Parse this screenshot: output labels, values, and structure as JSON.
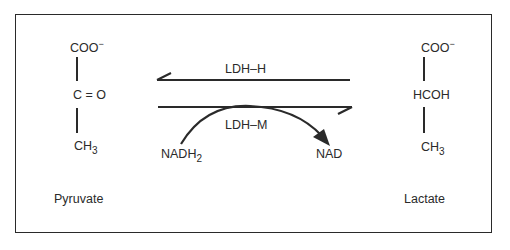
{
  "diagram": {
    "pyruvate": {
      "name": "Pyruvate",
      "top": "COO",
      "top_charge": "−",
      "middle": "C = O",
      "bottom": "CH",
      "bottom_sub": "3"
    },
    "lactate": {
      "name": "Lactate",
      "top": "COO",
      "top_charge": "−",
      "middle": "HCOH",
      "bottom": "CH",
      "bottom_sub": "3"
    },
    "reverse_arrow": {
      "label": "LDH–H",
      "direction": "lactate-to-pyruvate"
    },
    "forward_arrow": {
      "label": "LDH–M",
      "direction": "pyruvate-to-lactate"
    },
    "cofactor": {
      "from": "NADH",
      "from_sub": "2",
      "to": "NAD"
    },
    "colors": {
      "ink": "#2a2a2a",
      "background": "#ffffff"
    }
  }
}
